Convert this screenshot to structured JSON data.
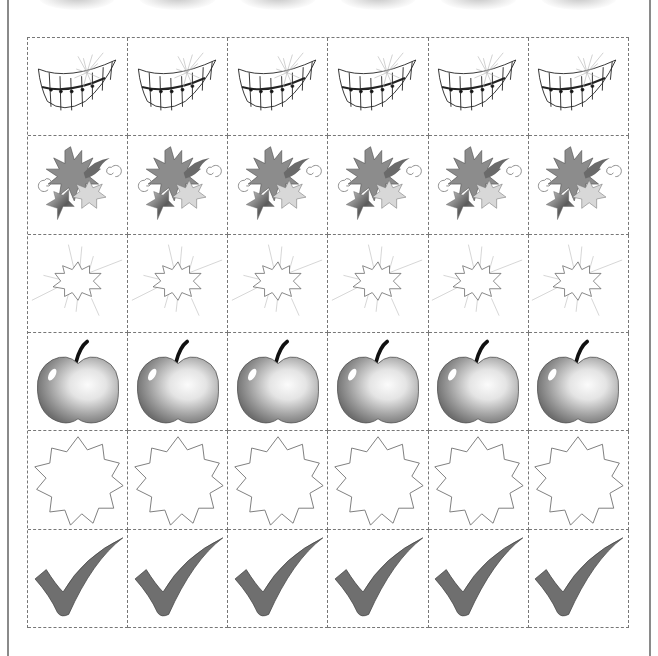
{
  "sheet": {
    "columns": 6,
    "rows": [
      {
        "name": "smile",
        "icon": "smiling-teeth-icon",
        "count": 6
      },
      {
        "name": "sparkle-stars",
        "icon": "sparkle-stars-icon",
        "count": 6
      },
      {
        "name": "burst",
        "icon": "burst-outline-icon",
        "count": 6
      },
      {
        "name": "apple",
        "icon": "apple-icon",
        "count": 6
      },
      {
        "name": "star-badge",
        "icon": "star-badge-outline-icon",
        "count": 6
      },
      {
        "name": "checkmark",
        "icon": "checkmark-icon",
        "count": 6
      }
    ],
    "colors": {
      "grid_line": "#777777",
      "page_border": "#8a8a8a",
      "checkmark_fill": "#6f6f6f",
      "apple_dark": "#7a7a7a",
      "apple_light": "#f2f2f2",
      "sun_fill": "#8c8c8c",
      "star_light_fill": "#d8d8d8"
    }
  }
}
